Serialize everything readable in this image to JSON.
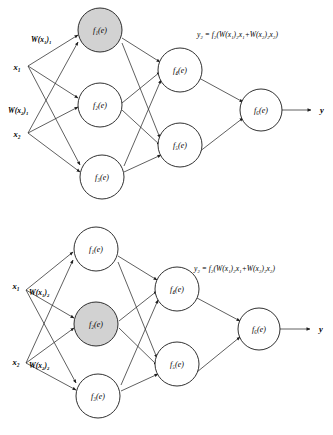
{
  "figure": {
    "colors": {
      "highlight_fill": "#d2d2d2",
      "node_fill": "#ffffff",
      "stroke": "#1a1a1a",
      "background": "#ffffff"
    }
  },
  "diagrams": [
    {
      "id": "top",
      "highlighted_node": "f1",
      "inputs": [
        {
          "id": "x1",
          "label": "x₁"
        },
        {
          "id": "x2",
          "label": "x₂"
        }
      ],
      "weights": [
        {
          "id": "w_x1_1",
          "label": "W(x₁)₁"
        },
        {
          "id": "w_x2_1",
          "label": "W(x₂)₁"
        }
      ],
      "hidden_layer_1": [
        {
          "id": "f1",
          "label": "f₁(e)",
          "highlighted": true
        },
        {
          "id": "f2",
          "label": "f₂(e)",
          "highlighted": false
        },
        {
          "id": "f3",
          "label": "f₃(e)",
          "highlighted": false
        }
      ],
      "hidden_layer_2": [
        {
          "id": "f4",
          "label": "f₄(e)",
          "highlighted": false
        },
        {
          "id": "f5",
          "label": "f₅(e)",
          "highlighted": false
        }
      ],
      "output_layer": [
        {
          "id": "f6",
          "label": "f₆(e)",
          "highlighted": false
        }
      ],
      "output": {
        "id": "y",
        "label": "y"
      },
      "formula": "y₂ = f₂(W(x₁)₂x₁+W(x₂)₂x₂)"
    },
    {
      "id": "bottom",
      "highlighted_node": "f2",
      "inputs": [
        {
          "id": "x1",
          "label": "x₁"
        },
        {
          "id": "x2",
          "label": "x₂"
        }
      ],
      "weights": [
        {
          "id": "w_x1_2",
          "label": "W(x₁)₂"
        },
        {
          "id": "w_x2_2",
          "label": "W(x₂)₂"
        }
      ],
      "hidden_layer_1": [
        {
          "id": "f1",
          "label": "f₁(e)",
          "highlighted": false
        },
        {
          "id": "f2",
          "label": "f₂(e)",
          "highlighted": true
        },
        {
          "id": "f3",
          "label": "f₃(e)",
          "highlighted": false
        }
      ],
      "hidden_layer_2": [
        {
          "id": "f4",
          "label": "f₄(e)",
          "highlighted": false
        },
        {
          "id": "f5",
          "label": "f₅(e)",
          "highlighted": false
        }
      ],
      "output_layer": [
        {
          "id": "f6",
          "label": "f₆(e)",
          "highlighted": false
        }
      ],
      "output": {
        "id": "y",
        "label": "y"
      },
      "formula": "y₂ = f₂(W(x₁)₂x₁+W(x₂)₂x₂)"
    }
  ]
}
